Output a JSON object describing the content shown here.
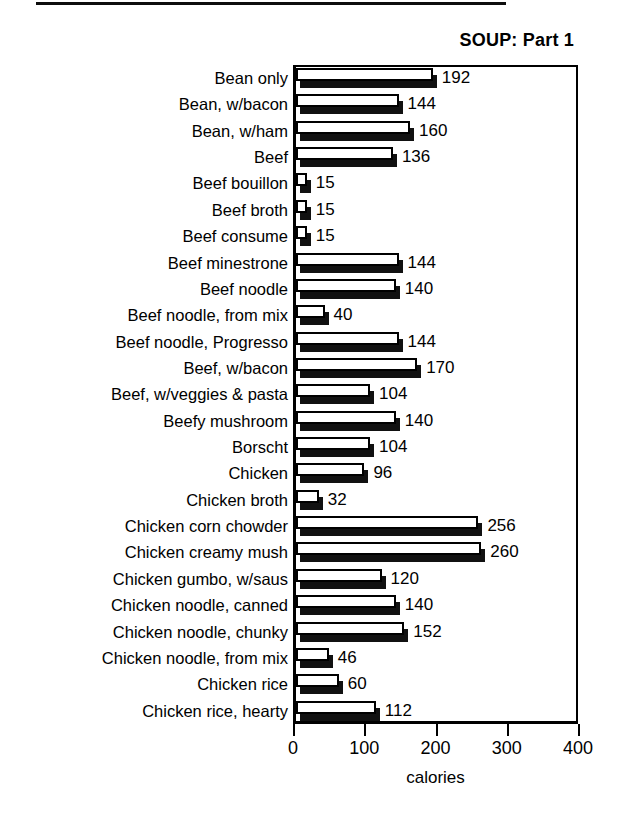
{
  "chart_data": {
    "type": "bar",
    "orientation": "horizontal",
    "title": "SOUP: Part 1",
    "xlabel": "calories",
    "ylabel": "",
    "xlim": [
      0,
      400
    ],
    "xticks": [
      0,
      100,
      200,
      300,
      400
    ],
    "grid": false,
    "legend": null,
    "style": "3d-shadow-bars",
    "categories": [
      "Bean only",
      "Bean, w/bacon",
      "Bean, w/ham",
      "Beef",
      "Beef bouillon",
      "Beef broth",
      "Beef consume",
      "Beef minestrone",
      "Beef noodle",
      "Beef noodle, from mix",
      "Beef noodle, Progresso",
      "Beef, w/bacon",
      "Beef, w/veggies & pasta",
      "Beefy mushroom",
      "Borscht",
      "Chicken",
      "Chicken broth",
      "Chicken corn chowder",
      "Chicken creamy mush",
      "Chicken gumbo, w/saus",
      "Chicken noodle, canned",
      "Chicken noodle, chunky",
      "Chicken noodle, from mix",
      "Chicken rice",
      "Chicken rice, hearty"
    ],
    "values": [
      192,
      144,
      160,
      136,
      15,
      15,
      15,
      144,
      140,
      40,
      144,
      170,
      104,
      140,
      104,
      96,
      32,
      256,
      260,
      120,
      140,
      152,
      46,
      60,
      112
    ],
    "value_labels": [
      "192",
      "144",
      "160",
      "136",
      "15",
      "15",
      "15",
      "144",
      "140",
      "40",
      "144",
      "170",
      "104",
      "140",
      "104",
      "96",
      "32",
      "256",
      "260",
      "120",
      "140",
      "152",
      "46",
      "60",
      "112"
    ],
    "xtick_labels": [
      "0",
      "100",
      "200",
      "300",
      "400"
    ]
  }
}
